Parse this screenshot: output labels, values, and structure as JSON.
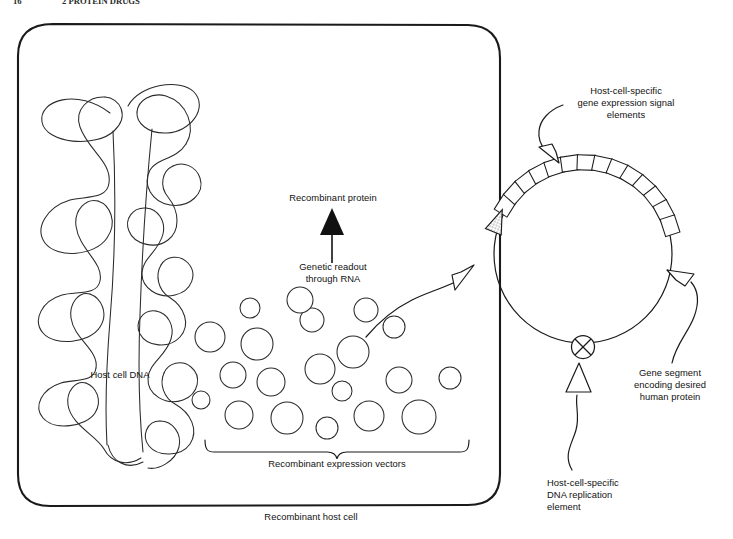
{
  "figure": {
    "background_color": "#ffffff",
    "ink_color": "#1a1a1a"
  },
  "header": {
    "folio": "16",
    "running_title": "2 PROTEIN DRUGS"
  },
  "labels": {
    "host_cell_dna": "Host cell DNA",
    "recombinant_protein": "Recombinant protein",
    "genetic_readout": "Genetic readout\nthrough RNA",
    "recombinant_expression_vectors": "Recombinant expression vectors",
    "recombinant_host_cell": "Recombinant host cell",
    "gene_expression_signal": "Host-cell-specific\ngene expression signal\nelements",
    "gene_segment": "Gene segment\nencoding desired\nhuman protein",
    "dna_replication_element": "Host-cell-specific\nDNA replication\nelement"
  },
  "diagram_parts": {
    "cell_membrane": "rounded-rectangle-cell-outline",
    "supercoiled_dna": "host-chromosomal-dna-supercoil",
    "plasmid_ring": "circular-expression-vector",
    "promoter_element": "stippled-triangle-promoter",
    "gene_segment_boxes": 14,
    "replication_origin": "circled-x-origin-of-replication",
    "vector_count": 20
  },
  "vectors": [
    {
      "cx": 210,
      "cy": 337,
      "r": 15
    },
    {
      "cx": 257,
      "cy": 344,
      "r": 16
    },
    {
      "cx": 312,
      "cy": 320,
      "r": 12
    },
    {
      "cx": 353,
      "cy": 352,
      "r": 16
    },
    {
      "cx": 320,
      "cy": 369,
      "r": 15
    },
    {
      "cx": 271,
      "cy": 382,
      "r": 14
    },
    {
      "cx": 233,
      "cy": 375,
      "r": 13
    },
    {
      "cx": 394,
      "cy": 327,
      "r": 11
    },
    {
      "cx": 342,
      "cy": 391,
      "r": 10
    },
    {
      "cx": 399,
      "cy": 380,
      "r": 13
    },
    {
      "cx": 201,
      "cy": 400,
      "r": 9
    },
    {
      "cx": 239,
      "cy": 415,
      "r": 14
    },
    {
      "cx": 287,
      "cy": 418,
      "r": 16
    },
    {
      "cx": 327,
      "cy": 428,
      "r": 11
    },
    {
      "cx": 369,
      "cy": 416,
      "r": 15
    },
    {
      "cx": 419,
      "cy": 417,
      "r": 17
    },
    {
      "cx": 450,
      "cy": 378,
      "r": 11
    },
    {
      "cx": 300,
      "cy": 300,
      "r": 13
    },
    {
      "cx": 366,
      "cy": 310,
      "r": 12
    },
    {
      "cx": 250,
      "cy": 308,
      "r": 10
    }
  ]
}
